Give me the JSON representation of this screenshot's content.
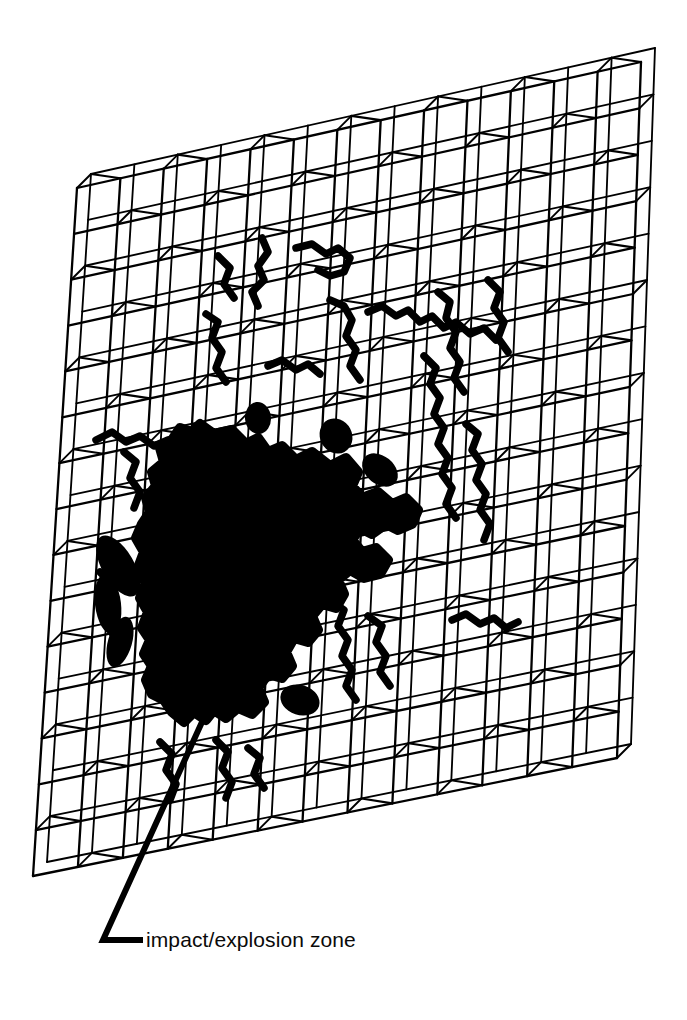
{
  "figure": {
    "background_color": "#ffffff",
    "ink_color": "#000000"
  },
  "callout": {
    "label": "impact/explosion zone",
    "leader_corner_x": 103,
    "leader_corner_y": 940,
    "leader_tip_x": 143,
    "leader_tip_y": 940,
    "leader_anchor_x": 212,
    "leader_anchor_y": 700
  },
  "lattice": {
    "columns": 13,
    "rows": 15,
    "line_color": "#000000",
    "line_width": 2.0,
    "depth_offset_x": 14,
    "depth_offset_y": -14,
    "front_corners": {
      "top_left_x": 77,
      "top_left_y": 188,
      "top_right_x": 641,
      "top_right_y": 62,
      "bottom_right_x": 617,
      "bottom_right_y": 758,
      "bottom_left_x": 33,
      "bottom_left_y": 876
    },
    "brace_pattern": "checkerboard"
  },
  "damage": {
    "zone_label": "impact/explosion zone",
    "blob_fill": "#000000",
    "crack_stroke": "#000000",
    "blob_outline": [
      [
        200,
        424
      ],
      [
        214,
        434
      ],
      [
        232,
        430
      ],
      [
        246,
        444
      ],
      [
        258,
        438
      ],
      [
        268,
        452
      ],
      [
        282,
        446
      ],
      [
        296,
        460
      ],
      [
        312,
        452
      ],
      [
        330,
        466
      ],
      [
        346,
        458
      ],
      [
        358,
        472
      ],
      [
        352,
        486
      ],
      [
        362,
        498
      ],
      [
        378,
        492
      ],
      [
        392,
        504
      ],
      [
        406,
        498
      ],
      [
        418,
        510
      ],
      [
        412,
        524
      ],
      [
        398,
        530
      ],
      [
        386,
        524
      ],
      [
        372,
        534
      ],
      [
        360,
        528
      ],
      [
        352,
        540
      ],
      [
        362,
        552
      ],
      [
        376,
        548
      ],
      [
        388,
        560
      ],
      [
        380,
        574
      ],
      [
        364,
        578
      ],
      [
        350,
        570
      ],
      [
        338,
        580
      ],
      [
        344,
        594
      ],
      [
        336,
        608
      ],
      [
        322,
        604
      ],
      [
        312,
        616
      ],
      [
        318,
        630
      ],
      [
        308,
        642
      ],
      [
        294,
        638
      ],
      [
        286,
        652
      ],
      [
        292,
        666
      ],
      [
        282,
        678
      ],
      [
        268,
        674
      ],
      [
        258,
        688
      ],
      [
        264,
        702
      ],
      [
        252,
        714
      ],
      [
        238,
        708
      ],
      [
        226,
        718
      ],
      [
        214,
        710
      ],
      [
        206,
        720
      ],
      [
        194,
        712
      ],
      [
        184,
        722
      ],
      [
        172,
        712
      ],
      [
        164,
        700
      ],
      [
        152,
        694
      ],
      [
        146,
        680
      ],
      [
        152,
        666
      ],
      [
        144,
        654
      ],
      [
        150,
        640
      ],
      [
        142,
        628
      ],
      [
        148,
        612
      ],
      [
        140,
        598
      ],
      [
        146,
        582
      ],
      [
        138,
        568
      ],
      [
        144,
        552
      ],
      [
        136,
        538
      ],
      [
        142,
        524
      ],
      [
        150,
        512
      ],
      [
        146,
        498
      ],
      [
        156,
        486
      ],
      [
        152,
        472
      ],
      [
        164,
        462
      ],
      [
        160,
        448
      ],
      [
        172,
        440
      ],
      [
        180,
        428
      ],
      [
        192,
        432
      ]
    ],
    "crack_paths": [
      {
        "name": "crack-upper-left",
        "points": [
          [
            262,
            238
          ],
          [
            268,
            252
          ],
          [
            258,
            266
          ],
          [
            264,
            280
          ],
          [
            252,
            292
          ],
          [
            258,
            306
          ]
        ]
      },
      {
        "name": "crack-upper-mid",
        "points": [
          [
            296,
            248
          ],
          [
            312,
            244
          ],
          [
            326,
            254
          ],
          [
            338,
            248
          ],
          [
            350,
            258
          ],
          [
            344,
            272
          ],
          [
            330,
            276
          ],
          [
            318,
            270
          ]
        ]
      },
      {
        "name": "crack-north",
        "points": [
          [
            330,
            300
          ],
          [
            344,
            306
          ],
          [
            352,
            320
          ],
          [
            346,
            336
          ],
          [
            356,
            350
          ],
          [
            350,
            366
          ],
          [
            360,
            380
          ]
        ]
      },
      {
        "name": "crack-ne-long",
        "points": [
          [
            368,
            312
          ],
          [
            382,
            306
          ],
          [
            396,
            316
          ],
          [
            408,
            310
          ],
          [
            420,
            322
          ],
          [
            432,
            316
          ],
          [
            444,
            328
          ],
          [
            456,
            322
          ],
          [
            470,
            334
          ],
          [
            484,
            328
          ],
          [
            496,
            340
          ]
        ]
      },
      {
        "name": "crack-east-upper",
        "points": [
          [
            438,
            292
          ],
          [
            450,
            302
          ],
          [
            446,
            318
          ],
          [
            456,
            332
          ],
          [
            450,
            348
          ],
          [
            460,
            362
          ],
          [
            454,
            378
          ],
          [
            464,
            392
          ]
        ]
      },
      {
        "name": "crack-east-spine",
        "points": [
          [
            424,
            356
          ],
          [
            436,
            368
          ],
          [
            430,
            384
          ],
          [
            440,
            398
          ],
          [
            434,
            414
          ],
          [
            444,
            428
          ],
          [
            438,
            444
          ],
          [
            448,
            458
          ],
          [
            442,
            474
          ],
          [
            452,
            488
          ],
          [
            446,
            504
          ],
          [
            456,
            518
          ]
        ]
      },
      {
        "name": "crack-east-lower",
        "points": [
          [
            466,
            424
          ],
          [
            478,
            434
          ],
          [
            472,
            450
          ],
          [
            482,
            464
          ],
          [
            476,
            480
          ],
          [
            486,
            494
          ],
          [
            480,
            510
          ],
          [
            490,
            524
          ],
          [
            484,
            540
          ]
        ]
      },
      {
        "name": "crack-far-east",
        "points": [
          [
            488,
            280
          ],
          [
            500,
            292
          ],
          [
            494,
            308
          ],
          [
            504,
            322
          ],
          [
            498,
            338
          ],
          [
            508,
            352
          ]
        ]
      },
      {
        "name": "crack-nw",
        "points": [
          [
            206,
            314
          ],
          [
            218,
            322
          ],
          [
            212,
            338
          ],
          [
            222,
            352
          ],
          [
            216,
            368
          ],
          [
            226,
            382
          ]
        ]
      },
      {
        "name": "crack-west-upper",
        "points": [
          [
            96,
            440
          ],
          [
            112,
            432
          ],
          [
            126,
            442
          ],
          [
            140,
            436
          ],
          [
            154,
            446
          ],
          [
            168,
            440
          ]
        ]
      },
      {
        "name": "crack-west-mid",
        "points": [
          [
            124,
            452
          ],
          [
            136,
            462
          ],
          [
            130,
            478
          ],
          [
            140,
            492
          ],
          [
            134,
            508
          ]
        ]
      },
      {
        "name": "crack-left-branch",
        "points": [
          [
            100,
            572
          ],
          [
            112,
            584
          ],
          [
            106,
            600
          ],
          [
            116,
            614
          ],
          [
            110,
            630
          ],
          [
            120,
            644
          ],
          [
            114,
            660
          ]
        ]
      },
      {
        "name": "crack-south-east",
        "points": [
          [
            330,
            600
          ],
          [
            344,
            610
          ],
          [
            338,
            626
          ],
          [
            348,
            640
          ],
          [
            342,
            656
          ],
          [
            352,
            670
          ],
          [
            346,
            686
          ],
          [
            356,
            700
          ]
        ]
      },
      {
        "name": "crack-south-east2",
        "points": [
          [
            368,
            616
          ],
          [
            382,
            626
          ],
          [
            376,
            642
          ],
          [
            386,
            656
          ],
          [
            380,
            672
          ],
          [
            390,
            686
          ]
        ]
      },
      {
        "name": "crack-e-mid-branch",
        "points": [
          [
            452,
            620
          ],
          [
            466,
            614
          ],
          [
            480,
            624
          ],
          [
            494,
            618
          ],
          [
            506,
            628
          ],
          [
            518,
            622
          ]
        ]
      },
      {
        "name": "crack-south",
        "points": [
          [
            216,
            740
          ],
          [
            228,
            752
          ],
          [
            222,
            768
          ],
          [
            232,
            782
          ],
          [
            226,
            798
          ]
        ]
      },
      {
        "name": "crack-south2",
        "points": [
          [
            248,
            748
          ],
          [
            260,
            758
          ],
          [
            254,
            774
          ],
          [
            264,
            788
          ]
        ]
      },
      {
        "name": "crack-southwest",
        "points": [
          [
            160,
            742
          ],
          [
            172,
            754
          ],
          [
            166,
            770
          ],
          [
            176,
            784
          ],
          [
            170,
            800
          ]
        ]
      },
      {
        "name": "crack-upper-far",
        "points": [
          [
            218,
            256
          ],
          [
            230,
            268
          ],
          [
            224,
            284
          ],
          [
            234,
            298
          ]
        ]
      },
      {
        "name": "crack-mid-center",
        "points": [
          [
            268,
            366
          ],
          [
            282,
            360
          ],
          [
            296,
            370
          ],
          [
            308,
            364
          ],
          [
            320,
            374
          ]
        ]
      }
    ]
  }
}
